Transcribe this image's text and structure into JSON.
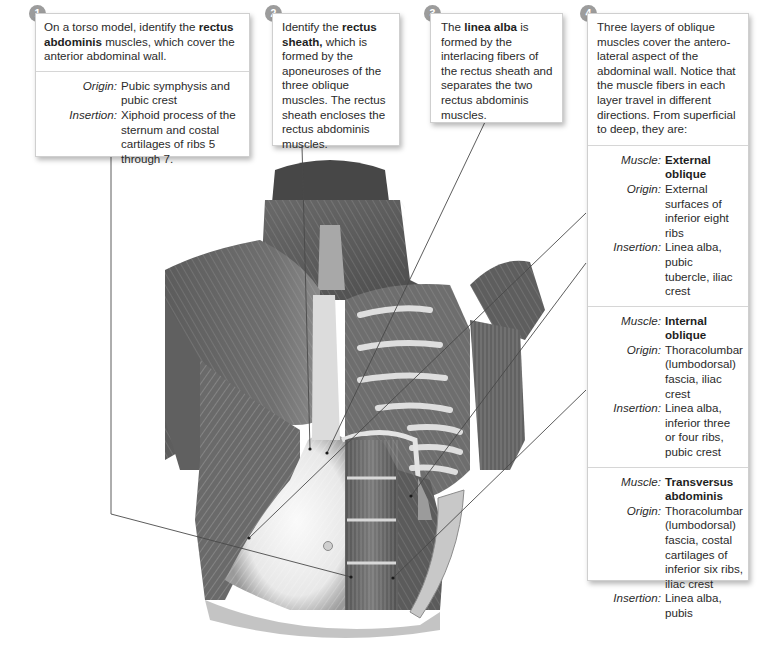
{
  "steps": [
    {
      "number": "1",
      "intro_pre": "On a torso model, identify the ",
      "intro_bold": "rectus abdominis",
      "intro_post": " muscles, which cover the anterior abdominal wall.",
      "fields": [
        {
          "label": "Origin:",
          "value": "Pubic symphysis and pubic crest"
        },
        {
          "label": "Insertion:",
          "value": "Xiphoid process of the sternum and costal cartilages of ribs 5 through 7."
        }
      ]
    },
    {
      "number": "2",
      "intro_pre": "Identify the ",
      "intro_bold": "rectus sheath,",
      "intro_post": " which is formed by the aponeuroses of the three oblique muscles. The rectus sheath encloses the rectus abdominis muscles."
    },
    {
      "number": "3",
      "intro_pre": "The ",
      "intro_bold": "linea alba",
      "intro_post": " is formed by the interlacing fibers of the rectus sheath and separates the two rectus abdominis muscles."
    },
    {
      "number": "4",
      "intro": "Three layers of oblique muscles cover the antero-lateral aspect of the abdominal wall. Notice that the muscle fibers in each layer travel in different directions. From superficial to deep, they are:",
      "muscles": [
        {
          "muscle_label": "Muscle:",
          "muscle": "External oblique",
          "origin_label": "Origin:",
          "origin": "External surfaces of inferior eight ribs",
          "insertion_label": "Insertion:",
          "insertion": "Linea alba, pubic tubercle, iliac crest"
        },
        {
          "muscle_label": "Muscle:",
          "muscle": "Internal oblique",
          "origin_label": "Origin:",
          "origin": "Thoracolumbar (lumbodorsal) fascia, iliac crest",
          "insertion_label": "Insertion:",
          "insertion": "Linea alba, inferior three or four ribs, pubic crest"
        },
        {
          "muscle_label": "Muscle:",
          "muscle": "Transversus abdominis",
          "origin_label": "Origin:",
          "origin": "Thoracolumbar (lumbodorsal) fascia, costal cartilages of inferior six ribs, iliac crest",
          "insertion_label": "Insertion:",
          "insertion": "Linea alba, pubis"
        }
      ]
    }
  ],
  "figure": {
    "colors": {
      "badge": "#9c9c9c",
      "leader": "#555555",
      "muscle_dark": "#5a5a5a",
      "muscle_light": "#e6e6e6"
    }
  }
}
